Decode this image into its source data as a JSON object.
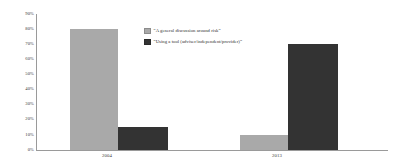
{
  "chart_data": {
    "type": "bar",
    "title": "",
    "subtitle": "",
    "xlabel": "",
    "ylabel": "",
    "categories": [
      "2004",
      "2013"
    ],
    "series": [
      {
        "name": "“A general discussion around risk”",
        "color": "#a9a9a9",
        "values": [
          80,
          10
        ]
      },
      {
        "name": "“Using a tool (adviser/independent/provider)”",
        "color": "#333333",
        "values": [
          15,
          70
        ]
      }
    ],
    "ylim": [
      0,
      90
    ],
    "ytick_labels": [
      "90%",
      "80%",
      "70%",
      "60%",
      "50%",
      "40%",
      "30%",
      "20%",
      "10%",
      "0%"
    ],
    "ytick_values": [
      90,
      80,
      70,
      60,
      50,
      40,
      30,
      20,
      10,
      0
    ],
    "grid": false,
    "legend_position": "inside-top-center",
    "value_suffix": "%"
  },
  "colors": {
    "series_light": "#a9a9a9",
    "series_dark": "#333333",
    "axis": "#9a9a9a",
    "text": "#3a3a3a",
    "background": "#ffffff"
  }
}
